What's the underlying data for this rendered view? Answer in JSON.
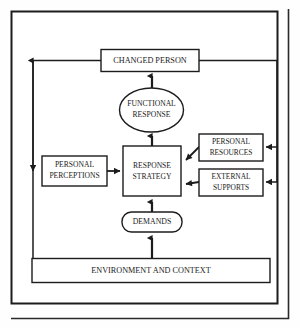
{
  "diagram": {
    "background_color": "#fefefe",
    "line_color": "#1c1c1c",
    "text_color": "#1a1a1a",
    "outer_frame": {
      "label": "outer-frame"
    },
    "nodes": {
      "changed_person": {
        "label": "CHANGED PERSON",
        "shape": "rectangle"
      },
      "functional_response": {
        "label_line1": "FUNCTIONAL",
        "label_line2": "RESPONSE",
        "shape": "ellipse"
      },
      "personal_perceptions": {
        "label_line1": "PERSONAL",
        "label_line2": "PERCEPTIONS",
        "shape": "rectangle"
      },
      "response_strategy": {
        "label_line1": "RESPONSE",
        "label_line2": "STRATEGY",
        "shape": "rectangle"
      },
      "personal_resources": {
        "label_line1": "PERSONAL",
        "label_line2": "RESOURCES",
        "shape": "rectangle"
      },
      "external_supports": {
        "label_line1": "EXTERNAL",
        "label_line2": "SUPPORTS",
        "shape": "rectangle"
      },
      "demands": {
        "label": "DEMANDS",
        "shape": "stadium"
      },
      "environment_and_context": {
        "label": "ENVIRONMENT AND CONTEXT",
        "shape": "rectangle"
      }
    },
    "edges": [
      {
        "from": "response_strategy",
        "to": "functional_response",
        "direction": "up"
      },
      {
        "from": "functional_response",
        "to": "changed_person",
        "direction": "up"
      },
      {
        "from": "personal_perceptions",
        "to": "response_strategy",
        "direction": "right"
      },
      {
        "from": "personal_resources",
        "to": "response_strategy",
        "direction": "left"
      },
      {
        "from": "external_supports",
        "to": "response_strategy",
        "direction": "left"
      },
      {
        "from": "demands",
        "to": "response_strategy",
        "direction": "up"
      },
      {
        "from": "environment_and_context",
        "to": "demands",
        "direction": "up"
      },
      {
        "from": "changed_person",
        "to": "personal_perceptions",
        "direction": "left-loop"
      },
      {
        "from": "changed_person",
        "to": "environment_and_context",
        "direction": "left-loop-down"
      },
      {
        "from": "changed_person",
        "to": "personal_resources",
        "direction": "right-loop"
      },
      {
        "from": "changed_person",
        "to": "external_supports",
        "direction": "right-loop"
      }
    ]
  }
}
